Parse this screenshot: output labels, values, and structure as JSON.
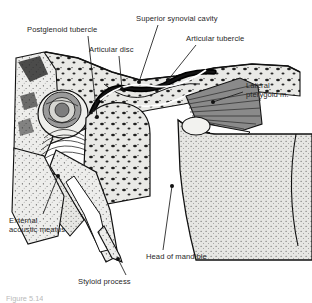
{
  "figure": {
    "caption": "Figure 5.14",
    "background": "#ffffff",
    "label_color": "#262626",
    "leader_color": "#1a1a1a"
  },
  "labels": [
    {
      "id": "postglenoid-tubercle",
      "text": "Postglenoid tubercle",
      "x": 27,
      "y": 25,
      "leader": [
        [
          88,
          36
        ],
        [
          97,
          117
        ]
      ],
      "dot": [
        97,
        117
      ]
    },
    {
      "id": "articular-disc",
      "text": "Articular disc",
      "x": 89,
      "y": 45,
      "leader": [
        [
          119,
          56
        ],
        [
          122,
          89
        ]
      ],
      "dot": [
        122,
        89
      ]
    },
    {
      "id": "superior-synovial-cavity",
      "text": "Superior synovial cavity",
      "x": 136,
      "y": 14,
      "leader": [
        [
          158,
          25
        ],
        [
          139,
          82
        ]
      ],
      "dot": [
        139,
        82
      ]
    },
    {
      "id": "articular-tubercle",
      "text": "Articular tubercle",
      "x": 186,
      "y": 34,
      "leader": [
        [
          196,
          45
        ],
        [
          168,
          80
        ]
      ],
      "dot": [
        168,
        80
      ]
    },
    {
      "id": "lateral-pterygoid-muscle",
      "text": "Lateral\npterygoid m.",
      "x": 246,
      "y": 81,
      "leader": [
        [
          243,
          92
        ],
        [
          213,
          102
        ]
      ],
      "dot": [
        213,
        102
      ]
    },
    {
      "id": "external-acoustic-meatus",
      "text": "External\nacoustic meatus",
      "x": 9,
      "y": 216,
      "leader": [
        [
          43,
          214
        ],
        [
          58,
          176
        ]
      ],
      "dot": [
        58,
        176
      ]
    },
    {
      "id": "head-of-mandible",
      "text": "Head of mandible",
      "x": 146,
      "y": 252,
      "leader": [
        [
          163,
          250
        ],
        [
          172,
          186
        ]
      ],
      "dot": [
        172,
        186
      ]
    },
    {
      "id": "styloid-process",
      "text": "Styloid process",
      "x": 78,
      "y": 277,
      "leader": [
        [
          126,
          275
        ],
        [
          118,
          259
        ]
      ],
      "dot": [
        118,
        259
      ]
    }
  ],
  "structures": {
    "temporal_bone": "Temporal bone with cancellous marrow spaces",
    "articular_disc": "Fibrocartilaginous articular disc (thick black band)",
    "lateral_pterygoid": "Lateral pterygoid muscle, striated fan",
    "mandibular_head": "Head of mandible, stippled cortical bone",
    "external_acoustic_meatus": "External acoustic meatus canal",
    "styloid_process": "Styloid process, tapering spine"
  }
}
